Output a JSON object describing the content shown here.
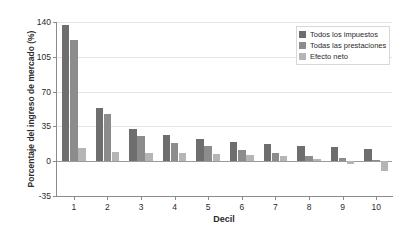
{
  "chart_data": {
    "type": "bar",
    "title": "",
    "xlabel": "Decil",
    "ylabel": "Porcentaje del ingreso de mercado (%)",
    "categories": [
      "1",
      "2",
      "3",
      "4",
      "5",
      "6",
      "7",
      "8",
      "9",
      "10"
    ],
    "series": [
      {
        "name": "Todos los impuestos",
        "color": "#6e6e6e",
        "values": [
          137,
          54,
          32,
          26,
          22,
          19,
          17,
          15,
          14,
          12
        ]
      },
      {
        "name": "Todas las prestaciones",
        "color": "#8c8c8c",
        "values": [
          122,
          47,
          25,
          18,
          15,
          11,
          8,
          5,
          3,
          1
        ]
      },
      {
        "name": "Efecto neto",
        "color": "#b5b5b5",
        "values": [
          13,
          9,
          8,
          8,
          7,
          6,
          5,
          2,
          -3,
          -10
        ]
      }
    ],
    "ylim": [
      -35,
      140
    ],
    "yticks": [
      "140",
      "105",
      "70",
      "35",
      "0",
      "-35"
    ],
    "ytick_values": [
      140,
      105,
      70,
      35,
      0,
      -35
    ],
    "grid": true,
    "legend_position": "top-right"
  },
  "legend": {
    "items": [
      {
        "label": "Todos los impuestos",
        "color": "#6e6e6e"
      },
      {
        "label": "Todas las prestaciones",
        "color": "#8c8c8c"
      },
      {
        "label": "Efecto neto",
        "color": "#b5b5b5"
      }
    ]
  },
  "colors": {
    "axis": "#8a8a8a",
    "grid": "#e4e4e4",
    "zero": "#9a9a9a",
    "text": "#2b2b2b",
    "background": "#ffffff"
  }
}
